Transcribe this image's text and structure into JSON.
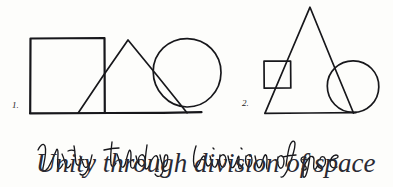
{
  "page": {
    "background_color": "#fdfdfb",
    "ink_color": "#17171b",
    "caption": "Unity through division of space",
    "caption_ink_color": "#2a2a33"
  },
  "figures": [
    {
      "label": "1.",
      "label_x": 12,
      "label_y": 108,
      "description": "square, triangle and circle overlapping along a common baseline",
      "shapes": [
        {
          "name": "square",
          "type": "rect",
          "x": 30,
          "y": 38,
          "width": 75,
          "height": 75,
          "stroke_weight": "heavy"
        },
        {
          "name": "triangle",
          "type": "polyline",
          "points": "78,113 128,40 187,113",
          "stroke_weight": "med"
        },
        {
          "name": "circle",
          "type": "circle",
          "cx": 187,
          "cy": 73,
          "r": 34,
          "stroke_weight": "med"
        },
        {
          "name": "baseline",
          "type": "line",
          "x1": 30,
          "y1": 113,
          "x2": 201,
          "y2": 113,
          "stroke_weight": "heavy"
        }
      ]
    },
    {
      "label": "2.",
      "label_x": 242,
      "label_y": 106,
      "description": "tall triangle with a small square on its left slope and a circle on its right slope",
      "shapes": [
        {
          "name": "triangle",
          "type": "polyline",
          "points": "265,113 310,7 353,113",
          "stroke_weight": "med"
        },
        {
          "name": "square",
          "type": "rect",
          "x": 264,
          "y": 61,
          "width": 27,
          "height": 27,
          "stroke_weight": "med"
        },
        {
          "name": "circle",
          "type": "circle",
          "cx": 353,
          "cy": 87,
          "r": 26,
          "stroke_weight": "med"
        },
        {
          "name": "baseline",
          "type": "line",
          "x1": 265,
          "y1": 113,
          "x2": 356,
          "y2": 113,
          "stroke_weight": "med"
        }
      ]
    }
  ],
  "caption": {
    "text": "Unity through division of space",
    "words": [
      "Unity",
      "through",
      "division",
      "of",
      "space"
    ],
    "x": 36,
    "y": 172,
    "style": "cursive handwriting"
  }
}
